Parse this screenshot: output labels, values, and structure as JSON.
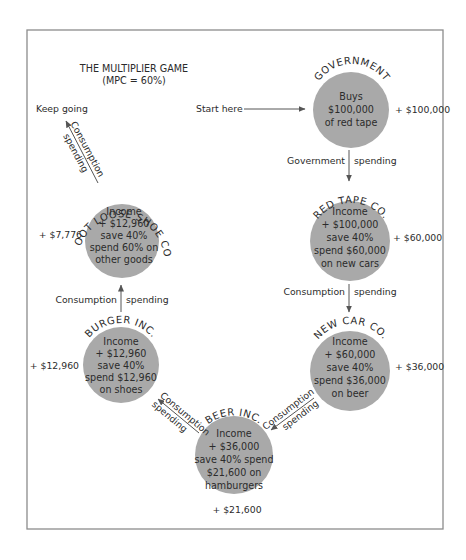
{
  "title": {
    "line1": "THE MULTIPLIER GAME",
    "line2": "(MPC = 60%)"
  },
  "colors": {
    "circle_fill": "#a9a9a9",
    "frame": "#8c8c8c",
    "arrow": "#555555",
    "text": "#2b2b2b"
  },
  "start_label": "Start here",
  "keep_going_label": "Keep going",
  "nodes": [
    {
      "name": "GOVERNMENT",
      "lines": [
        "Buys",
        "$100,000",
        "of red tape"
      ],
      "side_value": "+ $100,000"
    },
    {
      "name": "RED TAPE CO.",
      "lines": [
        "Income",
        "+ $100,000",
        "save 40%",
        "spend $60,000",
        "on new cars"
      ],
      "side_value": "+ $60,000"
    },
    {
      "name": "NEW CAR CO.",
      "lines": [
        "Income",
        "+ $60,000",
        "save 40%",
        "spend $36,000",
        "on beer"
      ],
      "side_value": "+ $36,000"
    },
    {
      "name": "BEER INC.",
      "lines": [
        "Income",
        "+ $36,000",
        "save 40% spend",
        "$21,600  on",
        "hamburgers"
      ],
      "side_value": "+ $21,600"
    },
    {
      "name": "BURGER INC.",
      "lines": [
        "Income",
        "+ $12,960",
        "save 40%",
        "spend $12,960",
        "on shoes"
      ],
      "side_value": "+ $12,960"
    },
    {
      "name": "FOOT LOOSE SHOE CO.",
      "lines": [
        "Income",
        "+ $12,960",
        "save 40%",
        "spend 60% on",
        "other goods"
      ],
      "side_value": "+ $7,776"
    }
  ],
  "flows": [
    {
      "left": "Government",
      "right": "spending"
    },
    {
      "left": "Consumption",
      "right": "spending"
    },
    {
      "top": "Consumption",
      "bottom": "spending"
    },
    {
      "top": "Consumption",
      "bottom": "spending"
    },
    {
      "left": "Consumption",
      "right": "spending"
    },
    {
      "top": "Consumption",
      "bottom": "spending"
    }
  ]
}
